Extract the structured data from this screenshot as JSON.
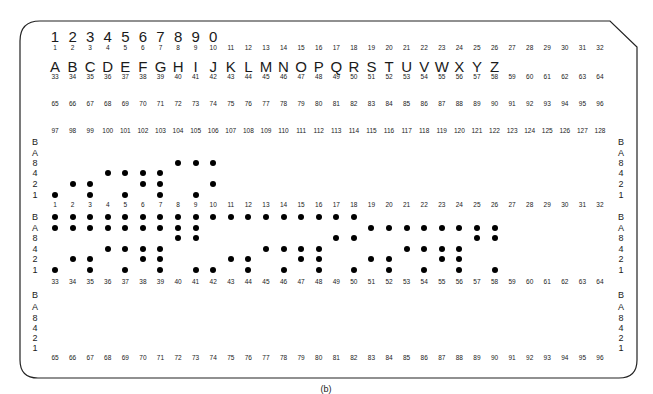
{
  "figure": {
    "caption": "(b)"
  },
  "header": {
    "digit_chars": [
      "1",
      "2",
      "3",
      "4",
      "5",
      "6",
      "7",
      "8",
      "9",
      "0"
    ],
    "letter_chars": [
      "A",
      "B",
      "C",
      "D",
      "E",
      "F",
      "G",
      "H",
      "I",
      "J",
      "K",
      "L",
      "M",
      "N",
      "O",
      "P",
      "Q",
      "R",
      "S",
      "T",
      "U",
      "V",
      "W",
      "X",
      "Y",
      "Z"
    ]
  },
  "column_number_rows": {
    "row_1_32": [
      "1",
      "2",
      "3",
      "4",
      "5",
      "6",
      "7",
      "8",
      "9",
      "10",
      "11",
      "12",
      "13",
      "14",
      "15",
      "16",
      "17",
      "18",
      "19",
      "20",
      "21",
      "22",
      "23",
      "24",
      "25",
      "26",
      "27",
      "28",
      "29",
      "30",
      "31",
      "32"
    ],
    "row_33_64": [
      "33",
      "34",
      "35",
      "36",
      "37",
      "38",
      "39",
      "40",
      "41",
      "42",
      "43",
      "44",
      "45",
      "46",
      "47",
      "48",
      "49",
      "50",
      "51",
      "52",
      "53",
      "54",
      "55",
      "56",
      "57",
      "58",
      "59",
      "60",
      "61",
      "62",
      "63",
      "64"
    ],
    "row_65_96": [
      "65",
      "66",
      "67",
      "68",
      "69",
      "70",
      "71",
      "72",
      "73",
      "74",
      "75",
      "76",
      "77",
      "78",
      "79",
      "80",
      "81",
      "82",
      "83",
      "84",
      "85",
      "86",
      "87",
      "88",
      "89",
      "90",
      "91",
      "92",
      "93",
      "94",
      "95",
      "96"
    ],
    "row_97_128": [
      "97",
      "98",
      "99",
      "100",
      "101",
      "102",
      "103",
      "104",
      "105",
      "106",
      "107",
      "108",
      "109",
      "110",
      "111",
      "112",
      "113",
      "114",
      "115",
      "116",
      "117",
      "118",
      "119",
      "120",
      "121",
      "122",
      "123",
      "124",
      "125",
      "126",
      "127",
      "128"
    ]
  },
  "bit_labels": [
    "B",
    "A",
    "8",
    "4",
    "2",
    "1"
  ],
  "tiers": [
    {
      "name": "upper-tier",
      "punches": {
        "1": [
          "1"
        ],
        "2": [
          "2"
        ],
        "3": [
          "2",
          "1"
        ],
        "4": [
          "4"
        ],
        "5": [
          "4",
          "1"
        ],
        "6": [
          "4",
          "2"
        ],
        "7": [
          "4",
          "2",
          "1"
        ],
        "8": [
          "8"
        ],
        "9": [
          "8",
          "1"
        ],
        "10": [
          "8",
          "2"
        ]
      }
    },
    {
      "name": "middle-tier",
      "punches": {
        "1": [
          "B",
          "A",
          "1"
        ],
        "2": [
          "B",
          "A",
          "2"
        ],
        "3": [
          "B",
          "A",
          "2",
          "1"
        ],
        "4": [
          "B",
          "A",
          "4"
        ],
        "5": [
          "B",
          "A",
          "4",
          "1"
        ],
        "6": [
          "B",
          "A",
          "4",
          "2"
        ],
        "7": [
          "B",
          "A",
          "4",
          "2",
          "1"
        ],
        "8": [
          "B",
          "A",
          "8"
        ],
        "9": [
          "B",
          "A",
          "8",
          "1"
        ],
        "10": [
          "B",
          "1"
        ],
        "11": [
          "B",
          "2"
        ],
        "12": [
          "B",
          "2",
          "1"
        ],
        "13": [
          "B",
          "4"
        ],
        "14": [
          "B",
          "4",
          "1"
        ],
        "15": [
          "B",
          "4",
          "2"
        ],
        "16": [
          "B",
          "4",
          "2",
          "1"
        ],
        "17": [
          "B",
          "8"
        ],
        "18": [
          "B",
          "8",
          "1"
        ],
        "19": [
          "A",
          "2"
        ],
        "20": [
          "A",
          "2",
          "1"
        ],
        "21": [
          "A",
          "4"
        ],
        "22": [
          "A",
          "4",
          "1"
        ],
        "23": [
          "A",
          "4",
          "2"
        ],
        "24": [
          "A",
          "4",
          "2",
          "1"
        ],
        "25": [
          "A",
          "8"
        ],
        "26": [
          "A",
          "8",
          "1"
        ]
      }
    },
    {
      "name": "lower-tier",
      "punches": {}
    }
  ],
  "colors": {
    "ink": "#1a1a1a",
    "hole": "#000000",
    "card_border": "#222222",
    "background": "#ffffff"
  }
}
